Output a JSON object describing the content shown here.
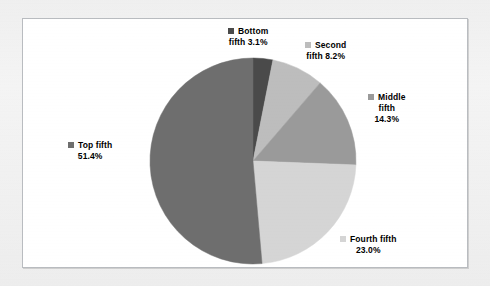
{
  "figure": {
    "background_color": "#f1f1f1",
    "panel_color": "#ffffff",
    "border_color": "#b9bcc0"
  },
  "chart_data": {
    "type": "pie",
    "title": "",
    "subtitle": "",
    "xlabel": "",
    "ylabel": "",
    "legend_position": "callout-labels",
    "grid": false,
    "start_angle_deg": 0,
    "direction": "clockwise",
    "categories": [
      "Bottom fifth",
      "Second fifth",
      "Middle fifth",
      "Fourth fifth",
      "Top fifth"
    ],
    "values": [
      3.1,
      8.2,
      14.3,
      23.0,
      51.4
    ],
    "value_unit": "%",
    "colors": [
      "#4a4a4a",
      "#bdbdbd",
      "#9a9a9a",
      "#d5d5d5",
      "#6e6e6e"
    ],
    "slices": [
      {
        "name": "Bottom fifth",
        "value": 3.1,
        "value_label": "3.1%",
        "color": "#4a4a4a",
        "label_lines": [
          "Bottom",
          "fifth 3.1%"
        ]
      },
      {
        "name": "Second fifth",
        "value": 8.2,
        "value_label": "8.2%",
        "color": "#bdbdbd",
        "label_lines": [
          "Second",
          "fifth 8.2%"
        ]
      },
      {
        "name": "Middle fifth",
        "value": 14.3,
        "value_label": "14.3%",
        "color": "#9a9a9a",
        "label_lines": [
          "Middle",
          "fifth",
          "14.3%"
        ]
      },
      {
        "name": "Fourth fifth",
        "value": 23.0,
        "value_label": "23.0%",
        "color": "#d5d5d5",
        "label_lines": [
          "Fourth fifth",
          "23.0%"
        ]
      },
      {
        "name": "Top fifth",
        "value": 51.4,
        "value_label": "51.4%",
        "color": "#6e6e6e",
        "label_lines": [
          "Top fifth",
          "51.4%"
        ]
      }
    ],
    "geometry": {
      "center_x": 253,
      "center_y": 161,
      "radius": 103
    }
  },
  "labels": {
    "bottom": {
      "line1": "Bottom",
      "line2": "fifth 3.1%"
    },
    "second": {
      "line1": "Second",
      "line2": "fifth 8.2%"
    },
    "middle": {
      "line1": "Middle",
      "line2": "fifth",
      "line3": "14.3%"
    },
    "fourth": {
      "line1": "Fourth fifth",
      "line2": "23.0%"
    },
    "top": {
      "line1": "Top fifth",
      "line2": "51.4%"
    }
  }
}
